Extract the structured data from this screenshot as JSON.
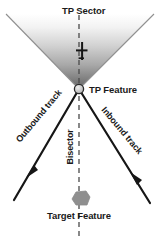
{
  "diagram": {
    "title": "TP Sector",
    "labels": {
      "tp_sector": "TP Sector",
      "tp_feature": "TP Feature",
      "target_feature": "Target Feature",
      "outbound_track": "Outbound track",
      "inbound_track": "Inbound track",
      "bisector": "Bisector"
    },
    "elements": {
      "sector_cone": {
        "name": "tp-sector-cone",
        "description": "shaded V-shaped sector opening upward from TP feature",
        "apex": {
          "x": 79,
          "y": 89
        },
        "left_edge_end": {
          "x": 6,
          "y": 14
        },
        "right_edge_end": {
          "x": 154,
          "y": 14
        },
        "fill_top_color": "#ffffff",
        "fill_bottom_color": "#6e6e6e",
        "edge_color": "#8c8c8c"
      },
      "tp_feature_node": {
        "name": "tp-feature-node",
        "center": {
          "x": 79,
          "y": 89
        },
        "radius": 4.5,
        "fill_color": "#c9c9c9",
        "stroke_color": "#2b2b2b"
      },
      "aircraft_symbol": {
        "name": "aircraft-symbol",
        "center": {
          "x": 82,
          "y": 51
        },
        "color": "#161616"
      },
      "outbound_track_line": {
        "name": "outbound-track-line",
        "from": {
          "x": 79,
          "y": 89
        },
        "to": {
          "x": 14,
          "y": 200
        },
        "arrow_at": {
          "x": 31,
          "y": 172
        },
        "color": "#161616",
        "width": 2.2
      },
      "inbound_track_line": {
        "name": "inbound-track-line",
        "from": {
          "x": 79,
          "y": 89
        },
        "to": {
          "x": 150,
          "y": 203
        },
        "arrow_at": {
          "x": 133,
          "y": 176
        },
        "arrow_direction": "toward-tp-feature",
        "color": "#161616",
        "width": 2.2
      },
      "bisector_line": {
        "name": "bisector-dashed-line",
        "from": {
          "x": 79,
          "y": 15
        },
        "to": {
          "x": 79,
          "y": 239
        },
        "color": "#4a4a4a",
        "dash": "5,4",
        "width": 1.3
      },
      "target_feature_shape": {
        "name": "target-feature-polygon",
        "center": {
          "x": 80,
          "y": 199
        },
        "fill_color": "#8f8f8f",
        "stroke_color": "#8f8f8f"
      }
    }
  }
}
